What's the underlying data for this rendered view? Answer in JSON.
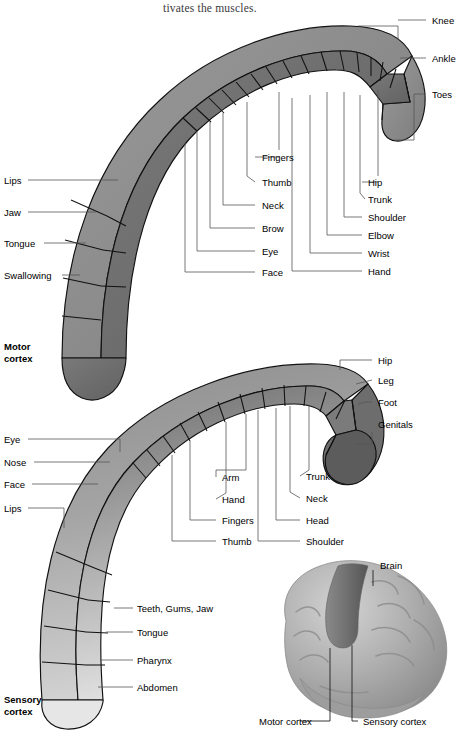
{
  "page": {
    "top_text": "tivates the muscles.",
    "background": "#ffffff"
  },
  "colors": {
    "motor_outer": "#8b8b8b",
    "motor_inner": "#6f6f6f",
    "motor_dark": "#5a5a5a",
    "sensory_outer": "#9a9a9a",
    "sensory_inner": "#b9b9b9",
    "sensory_light": "#dcdcdc",
    "sensory_dark": "#5f5f5f",
    "outline": "#111111",
    "leader": "#555555",
    "brain_body": "#a8a8a8",
    "brain_strip": "#6a6a6a"
  },
  "motor_cortex": {
    "caption_line1": "Motor",
    "caption_line2": "cortex",
    "left_labels": [
      {
        "text": "Lips",
        "x": 4,
        "y": 180
      },
      {
        "text": "Jaw",
        "x": 4,
        "y": 212
      },
      {
        "text": "Tongue",
        "x": 4,
        "y": 243
      },
      {
        "text": "Swallowing",
        "x": 4,
        "y": 275
      }
    ],
    "center_labels": [
      {
        "text": "Fingers",
        "x": 262,
        "y": 157
      },
      {
        "text": "Thumb",
        "x": 262,
        "y": 182
      },
      {
        "text": "Neck",
        "x": 262,
        "y": 205
      },
      {
        "text": "Brow",
        "x": 262,
        "y": 228
      },
      {
        "text": "Eye",
        "x": 262,
        "y": 251
      },
      {
        "text": "Face",
        "x": 262,
        "y": 272
      }
    ],
    "right_labels": [
      {
        "text": "Hip",
        "x": 368,
        "y": 182
      },
      {
        "text": "Trunk",
        "x": 368,
        "y": 199
      },
      {
        "text": "Shoulder",
        "x": 368,
        "y": 217
      },
      {
        "text": "Elbow",
        "x": 368,
        "y": 235
      },
      {
        "text": "Wrist",
        "x": 368,
        "y": 253
      },
      {
        "text": "Hand",
        "x": 368,
        "y": 271
      }
    ],
    "top_right_labels": [
      {
        "text": "Knee",
        "x": 432,
        "y": 20
      },
      {
        "text": "Ankle",
        "x": 432,
        "y": 58
      },
      {
        "text": "Toes",
        "x": 432,
        "y": 94
      }
    ]
  },
  "sensory_cortex": {
    "caption_line1": "Sensory",
    "caption_line2": "cortex",
    "left_labels": [
      {
        "text": "Eye",
        "x": 4,
        "y": 439
      },
      {
        "text": "Nose",
        "x": 4,
        "y": 462
      },
      {
        "text": "Face",
        "x": 4,
        "y": 484
      },
      {
        "text": "Lips",
        "x": 4,
        "y": 508
      }
    ],
    "lower_left_labels": [
      {
        "text": "Teeth, Gums, Jaw",
        "x": 137,
        "y": 608
      },
      {
        "text": "Tongue",
        "x": 137,
        "y": 632
      },
      {
        "text": "Pharynx",
        "x": 137,
        "y": 660
      },
      {
        "text": "Abdomen",
        "x": 137,
        "y": 687
      }
    ],
    "center_labels": [
      {
        "text": "Arm",
        "x": 222,
        "y": 477
      },
      {
        "text": "Hand",
        "x": 222,
        "y": 499
      },
      {
        "text": "Fingers",
        "x": 222,
        "y": 520
      },
      {
        "text": "Thumb",
        "x": 222,
        "y": 541
      }
    ],
    "center_right_labels": [
      {
        "text": "Trunk",
        "x": 306,
        "y": 476
      },
      {
        "text": "Neck",
        "x": 306,
        "y": 498
      },
      {
        "text": "Head",
        "x": 306,
        "y": 520
      },
      {
        "text": "Shoulder",
        "x": 306,
        "y": 541
      }
    ],
    "right_labels": [
      {
        "text": "Hip",
        "x": 378,
        "y": 360
      },
      {
        "text": "Leg",
        "x": 378,
        "y": 380
      },
      {
        "text": "Foot",
        "x": 378,
        "y": 402
      },
      {
        "text": "Genitals",
        "x": 378,
        "y": 424
      }
    ]
  },
  "brain_figure": {
    "labels": [
      {
        "text": "Brain",
        "x": 380,
        "y": 565
      },
      {
        "text": "Motor cortex",
        "x": 259,
        "y": 721
      },
      {
        "text": "Sensory cortex",
        "x": 363,
        "y": 721
      }
    ]
  }
}
